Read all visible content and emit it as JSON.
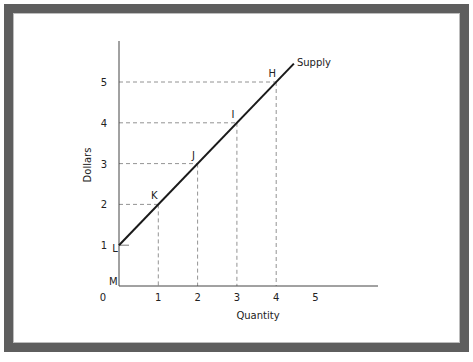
{
  "chart_data": {
    "type": "line",
    "title": "",
    "xlabel": "Quantity",
    "ylabel": "Dollars",
    "xlim": [
      0,
      6
    ],
    "ylim": [
      0,
      5.5
    ],
    "x_ticks": [
      "0",
      "1",
      "2",
      "3",
      "4",
      "5"
    ],
    "y_ticks": [
      "1",
      "2",
      "3",
      "4",
      "5"
    ],
    "origin_label": "M",
    "grid": false,
    "series": [
      {
        "name": "Supply",
        "points": [
          {
            "x": 0,
            "y": 1,
            "label": "L"
          },
          {
            "x": 1,
            "y": 2,
            "label": "K"
          },
          {
            "x": 2,
            "y": 3,
            "label": "J"
          },
          {
            "x": 3,
            "y": 4,
            "label": "I"
          },
          {
            "x": 4,
            "y": 5,
            "label": "H"
          }
        ],
        "line_extends_to": {
          "x": 4.45,
          "y": 5.45
        },
        "color": "#1a1a1a"
      }
    ],
    "guide_lines": [
      {
        "x": 1,
        "y": 2
      },
      {
        "x": 2,
        "y": 3
      },
      {
        "x": 3,
        "y": 4
      },
      {
        "x": 4,
        "y": 5
      }
    ],
    "y5_guide_extends_to_x": 4,
    "annotations": [
      {
        "text": "Supply",
        "near": "line-end"
      }
    ]
  },
  "frame": {
    "border_color": "#5e5e5e"
  }
}
